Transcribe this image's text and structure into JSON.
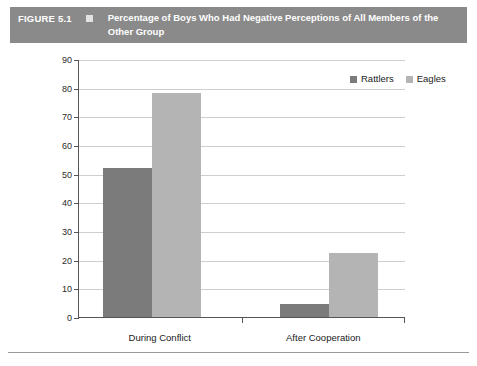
{
  "figure": {
    "label": "FIGURE 5.1",
    "title": "Percentage of Boys Who Had Negative Perceptions of All Members of the Other Group",
    "banner_color": "#8a8a8a",
    "banner_text_color": "#ffffff",
    "bullet_color": "#e2e2e2"
  },
  "chart_data": {
    "type": "bar",
    "title": "Percentage of Boys Who Had Negative Perceptions of All Members of the Other Group",
    "categories": [
      "During Conflict",
      "After Cooperation"
    ],
    "series": [
      {
        "name": "Rattlers",
        "values": [
          52,
          4.5
        ],
        "color": "#7b7b7b"
      },
      {
        "name": "Eagles",
        "values": [
          78,
          22.5
        ],
        "color": "#b4b4b4"
      }
    ],
    "xlabel": "",
    "ylabel": "",
    "ylim": [
      0,
      90
    ],
    "yticks": [
      0,
      10,
      20,
      30,
      40,
      50,
      60,
      70,
      80,
      90
    ],
    "ytick_labels": [
      "0",
      "10",
      "20",
      "30",
      "40",
      "50",
      "60",
      "70",
      "80",
      "90"
    ],
    "grid": true,
    "grid_axis": "y",
    "legend": true,
    "legend_position": "top-right",
    "legend_entries": [
      "Rattlers",
      "Eagles"
    ]
  }
}
